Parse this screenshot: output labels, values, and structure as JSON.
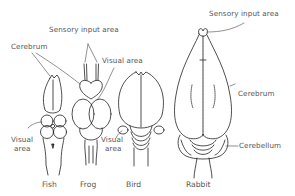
{
  "diagram": {
    "animals": [
      {
        "id": "fish",
        "caption": "Fish"
      },
      {
        "id": "frog",
        "caption": "Frog"
      },
      {
        "id": "bird",
        "caption": "Bird"
      },
      {
        "id": "rabbit",
        "caption": "Rabbit"
      }
    ],
    "labels": {
      "sensory_left": "Sensory input area",
      "cerebrum_left": "Cerebrum",
      "visual_top": "Visual area",
      "visual_fish_line1": "Visual",
      "visual_fish_line2": "area",
      "visual_bird_line1": "Visual",
      "visual_bird_line2": "area",
      "sensory_right": "Sensory input area",
      "cerebrum_right": "Cerebrum",
      "cerebellum": "Cerebellum"
    },
    "colors": {
      "line": "#222222",
      "text": "#555555",
      "background": "#ffffff"
    }
  }
}
